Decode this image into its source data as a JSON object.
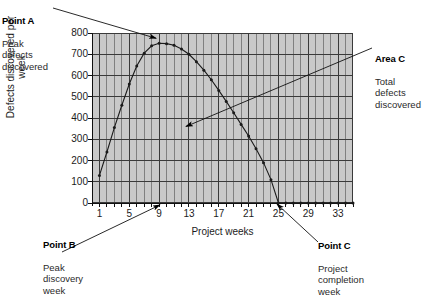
{
  "chart_data": {
    "type": "line",
    "title": "",
    "xlabel": "Project weeks",
    "ylabel": "Defects discovered per week",
    "xlim": [
      0,
      35
    ],
    "ylim": [
      0,
      800
    ],
    "xticks": [
      "1",
      "5",
      "9",
      "13",
      "17",
      "21",
      "25",
      "29",
      "33"
    ],
    "xtick_values": [
      1,
      5,
      9,
      13,
      17,
      21,
      25,
      29,
      33
    ],
    "yticks": [
      "0",
      "100",
      "200",
      "300",
      "400",
      "500",
      "600",
      "700",
      "800"
    ],
    "ytick_values": [
      0,
      100,
      200,
      300,
      400,
      500,
      600,
      700,
      800
    ],
    "grid": "both",
    "grid_minor_x": "every week",
    "legend": "none",
    "marker": "dot",
    "x": [
      1,
      2,
      3,
      4,
      5,
      6,
      7,
      8,
      9,
      10,
      11,
      12,
      13,
      14,
      15,
      16,
      17,
      18,
      19,
      20,
      21,
      22,
      23,
      24,
      25,
      26,
      27,
      28,
      29,
      30,
      31,
      32,
      33,
      34,
      35
    ],
    "values": [
      130,
      240,
      355,
      460,
      560,
      645,
      705,
      740,
      752,
      750,
      742,
      725,
      700,
      665,
      625,
      580,
      530,
      478,
      425,
      370,
      315,
      255,
      190,
      110,
      0,
      0,
      0,
      0,
      0,
      0,
      0,
      0,
      0,
      0,
      0
    ],
    "series": [
      {
        "name": "Defects discovered per week",
        "values": [
          130,
          240,
          355,
          460,
          560,
          645,
          705,
          740,
          752,
          750,
          742,
          725,
          700,
          665,
          625,
          580,
          530,
          478,
          425,
          370,
          315,
          255,
          190,
          110,
          0,
          0,
          0,
          0,
          0,
          0,
          0,
          0,
          0,
          0,
          0
        ]
      }
    ],
    "annotations": [
      {
        "id": "point-a",
        "heading": "Point A",
        "body": "Peak\ndefects\ndiscovered",
        "target_x": 9,
        "target_y": 760
      },
      {
        "id": "area-c",
        "heading": "Area C",
        "body": "Total\ndefects\ndiscovered",
        "target_x": 13,
        "target_y": 350
      },
      {
        "id": "point-b",
        "heading": "Point B",
        "body": "Peak\ndiscovery\nweek",
        "target_x": 9,
        "target_y": 0
      },
      {
        "id": "point-c",
        "heading": "Point C",
        "body": "Project\ncompletion\nweek",
        "target_x": 25,
        "target_y": 0
      }
    ]
  },
  "colors": {
    "plot_background": "#c9c9c9",
    "grid_major": "#3a3a3a",
    "grid_minor": "#6e6e6e",
    "curve": "#1a1a1a",
    "text": "#1b1b1b",
    "page_background": "#ffffff"
  },
  "annotations": {
    "point_a": {
      "heading": "Point A",
      "body": "Peak\ndefects\ndiscovered"
    },
    "area_c": {
      "heading": "Area C",
      "body": "Total\ndefects\ndiscovered"
    },
    "point_b": {
      "heading": "Point B",
      "body": "Peak\ndiscovery\nweek"
    },
    "point_c": {
      "heading": "Point C",
      "body": "Project\ncompletion\nweek"
    }
  },
  "axis": {
    "x_title": "Project weeks",
    "y_title": "Defects discovered per week"
  }
}
